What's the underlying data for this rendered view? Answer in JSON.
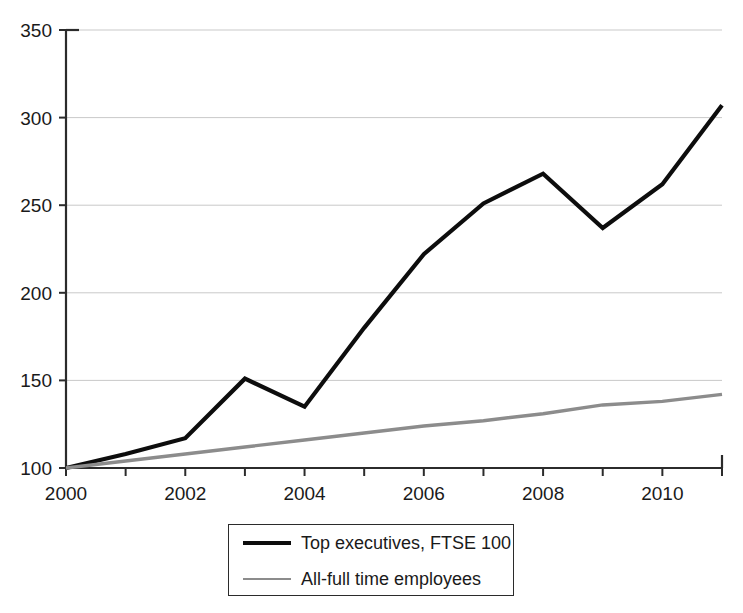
{
  "chart_data": {
    "type": "line",
    "title": "",
    "subtitle": "",
    "xlabel": "",
    "ylabel": "",
    "xlim": [
      2000,
      2011
    ],
    "ylim": [
      100,
      350
    ],
    "grid": true,
    "legend_position": "bottom-center",
    "x": [
      2000,
      2001,
      2002,
      2003,
      2004,
      2005,
      2006,
      2007,
      2008,
      2009,
      2010,
      2011
    ],
    "x_tick_labels": [
      "2000",
      "2002",
      "2004",
      "2006",
      "2008",
      "2010"
    ],
    "x_tick_values": [
      2000,
      2002,
      2004,
      2006,
      2008,
      2010
    ],
    "y_tick_labels": [
      "100",
      "150",
      "200",
      "250",
      "300",
      "350"
    ],
    "y_tick_values": [
      100,
      150,
      200,
      250,
      300,
      350
    ],
    "series": [
      {
        "name": "Top executives, FTSE 100",
        "color": "#0d0d0d",
        "width": 4.2,
        "values": [
          100,
          108,
          117,
          151,
          135,
          180,
          222,
          251,
          268,
          237,
          262,
          307
        ]
      },
      {
        "name": "All-full time employees",
        "color": "#8c8c8c",
        "width": 3.4,
        "values": [
          100,
          104,
          108,
          112,
          116,
          120,
          124,
          127,
          131,
          136,
          138,
          142
        ]
      }
    ]
  },
  "legend": {
    "entries": [
      {
        "label": "Top executives, FTSE 100"
      },
      {
        "label": "All-full time employees"
      }
    ]
  },
  "axes": {
    "y_labels": [
      "350",
      "300",
      "250",
      "200",
      "150",
      "100"
    ],
    "x_labels": [
      "2000",
      "2002",
      "2004",
      "2006",
      "2008",
      "2010"
    ]
  }
}
